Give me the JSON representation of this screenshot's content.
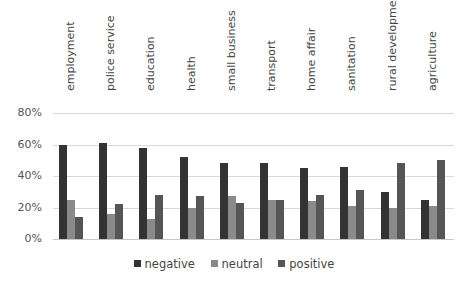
{
  "chart_data": {
    "type": "bar",
    "title": "",
    "xlabel": "",
    "ylabel": "",
    "ylim": [
      0,
      80
    ],
    "yticks": [
      "0%",
      "20%",
      "40%",
      "60%",
      "80%"
    ],
    "grid": true,
    "legend_position": "bottom",
    "categories": [
      "employment",
      "police service",
      "education",
      "health",
      "small business",
      "transport",
      "home affair",
      "sanitation",
      "rural development",
      "agriculture"
    ],
    "series": [
      {
        "name": "negative",
        "color": "#333333",
        "values": [
          60,
          61,
          58,
          52,
          48,
          48,
          45,
          46,
          30,
          25
        ]
      },
      {
        "name": "neutral",
        "color": "#8a8a8a",
        "values": [
          25,
          16,
          13,
          20,
          27,
          25,
          24,
          21,
          20,
          21
        ]
      },
      {
        "name": "positive",
        "color": "#555555",
        "values": [
          14,
          22,
          28,
          27,
          23,
          25,
          28,
          31,
          48,
          50
        ]
      }
    ]
  },
  "legend": {
    "items": [
      {
        "label": "negative",
        "color": "#333333"
      },
      {
        "label": "neutral",
        "color": "#8a8a8a"
      },
      {
        "label": "positive",
        "color": "#555555"
      }
    ]
  }
}
